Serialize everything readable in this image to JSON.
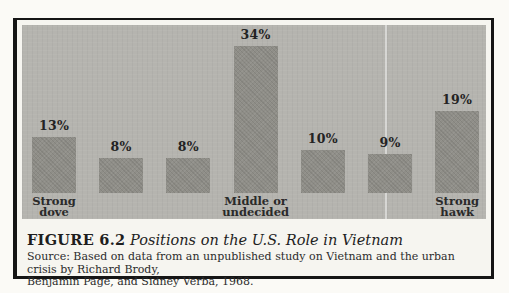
{
  "figure": {
    "label": "FIGURE 6.2",
    "title": "Positions on the U.S. Role in Vietnam",
    "source": "Source: Based on data from an unpublished study on Vietnam and the urban crisis by Richard Brody,\nBenjamin Page, and Sidney Verba, 1968."
  },
  "chart_data": {
    "type": "bar",
    "categories": [
      "Strong\ndove",
      "",
      "",
      "Middle or\nundecided",
      "",
      "",
      "Strong\nhawk"
    ],
    "values": [
      13,
      8,
      8,
      34,
      10,
      9,
      19
    ],
    "value_labels": [
      "13%",
      "8%",
      "8%",
      "34%",
      "10%",
      "9%",
      "19%"
    ],
    "title": "Positions on the U.S. Role in Vietnam",
    "xlabel": "",
    "ylabel": "",
    "ylim": [
      0,
      40
    ],
    "grid": false,
    "legend": false,
    "value_labels_position": "above-bars",
    "colors": {
      "bar": "#8f8e88",
      "plot_background": "#b5b4af",
      "frame_background": "#f6f5f0",
      "border": "#151515",
      "text": "#1e1e1e"
    }
  }
}
